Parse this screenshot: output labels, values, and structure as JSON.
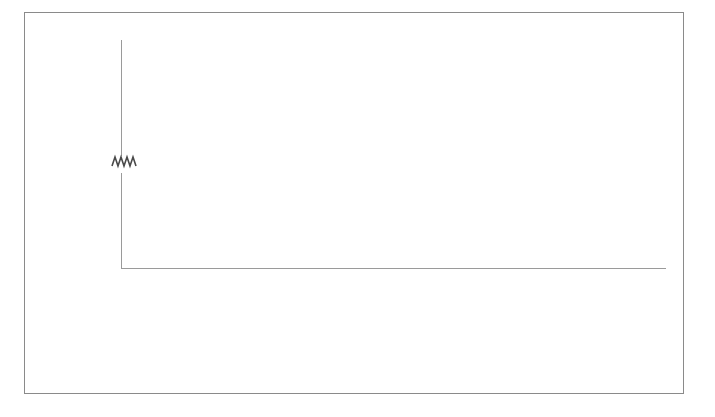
{
  "chart_data": {
    "type": "bar",
    "title": "",
    "xlabel": "",
    "ylabel": "",
    "grid": true,
    "legend_position": "bottom",
    "broken_axis": true,
    "axis_break_marker": "squiggle",
    "lower_axis": {
      "ylim": [
        0,
        9000
      ],
      "ticks": [
        "0",
        "2000",
        "4000",
        "6000",
        "8000"
      ],
      "tick_values": [
        0,
        2000,
        4000,
        6000,
        8000
      ]
    },
    "upper_axis": {
      "ylim": [
        45000,
        98000
      ],
      "ticks": [
        "45000",
        "55000",
        "65000",
        "75000",
        "85000",
        "95000"
      ],
      "tick_values": [
        45000,
        55000,
        65000,
        75000,
        85000,
        95000
      ]
    },
    "categories": [
      "Economy-SDA",
      "Terrorism",
      "Transportation",
      "aeo",
      "cl",
      "DOLCE-Lite",
      "fly-anatomy",
      "go",
      "plant",
      "fma"
    ],
    "series": [
      {
        "name": "Pellet",
        "color": "#5e5e5e",
        "values": [
          1300,
          330,
          1950,
          1300,
          1250,
          700,
          1100,
          2000,
          1350,
          9200
        ]
      },
      {
        "name": "Hermit",
        "color": "#6e6e6e",
        "values": [
          1450,
          350,
          2350,
          1450,
          1750,
          750,
          3100,
          3600,
          1400,
          9200
        ]
      },
      {
        "name": "Fact++",
        "color": "#7c7c7c",
        "values": [
          550,
          250,
          700,
          500,
          1100,
          300,
          1250,
          4600,
          500,
          47000
        ]
      },
      {
        "name": "Jfact",
        "color": "#a8a8a8",
        "values": [
          1950,
          480,
          4550,
          1400,
          1900,
          900,
          4650,
          8750,
          1600,
          91000
        ]
      },
      {
        "name": "Graph-based",
        "color": "#cfcfcf",
        "values": [
          120,
          90,
          160,
          140,
          150,
          110,
          180,
          1050,
          130,
          3900
        ]
      }
    ]
  },
  "legend": {
    "items": [
      {
        "label": "Pellet"
      },
      {
        "label": "Hermit"
      },
      {
        "label": "Fact++"
      },
      {
        "label": "Jfact"
      },
      {
        "label": "Graph-based"
      }
    ]
  }
}
